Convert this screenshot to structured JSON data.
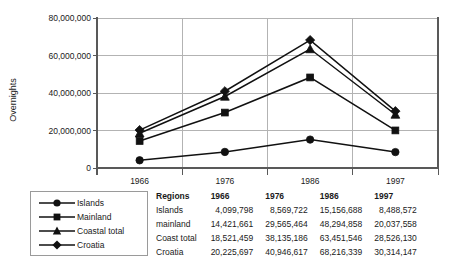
{
  "chart_data": {
    "type": "line",
    "title": "",
    "xlabel": "",
    "ylabel": "Overnights",
    "categories": [
      "1966",
      "1976",
      "1986",
      "1997"
    ],
    "ylim": [
      0,
      80000000
    ],
    "yticks": [
      0,
      20000000,
      40000000,
      60000000,
      80000000
    ],
    "ytick_labels": [
      "0",
      "20,000,000",
      "40,000,000",
      "60,000,000",
      "80,000,000"
    ],
    "grid": true,
    "legend_position": "below-left",
    "series": [
      {
        "name": "Islands",
        "marker": "circle",
        "values": [
          4099798,
          8569722,
          15156688,
          8488572
        ]
      },
      {
        "name": "Mainland",
        "marker": "square",
        "values": [
          14421661,
          29565464,
          48294858,
          20037558
        ]
      },
      {
        "name": "Coastal total",
        "marker": "triangle",
        "values": [
          18521459,
          38135186,
          63451546,
          28526130
        ]
      },
      {
        "name": "Croatia",
        "marker": "diamond",
        "values": [
          20225697,
          40946617,
          68216339,
          30314147
        ]
      }
    ]
  },
  "legend": {
    "items": [
      {
        "label": "Islands",
        "marker": "circle-marker"
      },
      {
        "label": "Mainland",
        "marker": "square-marker"
      },
      {
        "label": "Coastal total",
        "marker": "triangle-marker"
      },
      {
        "label": "Croatia",
        "marker": "diamond-marker"
      }
    ]
  },
  "table": {
    "headers": [
      "Regions",
      "1966",
      "1976",
      "1986",
      "1997"
    ],
    "rows": [
      {
        "region": "Islands",
        "v1966": "4,099,798",
        "v1976": "8,569,722",
        "v1986": "15,156,688",
        "v1997": "8,488,572"
      },
      {
        "region": "mainland",
        "v1966": "14,421,661",
        "v1976": "29,565,464",
        "v1986": "48,294,858",
        "v1997": "20,037,558"
      },
      {
        "region": "Coast total",
        "v1966": "18,521,459",
        "v1976": "38,135,186",
        "v1986": "63,451,546",
        "v1997": "28,526,130"
      },
      {
        "region": "Croatia",
        "v1966": "20,225,697",
        "v1976": "40,946,617",
        "v1986": "68,216,339",
        "v1997": "30,314,147"
      }
    ]
  },
  "colors": {
    "series": "#111111",
    "gridline": "#b3b3b3",
    "axis": "#595959",
    "legend_border": "#9a9a9a",
    "background": "#ffffff"
  }
}
